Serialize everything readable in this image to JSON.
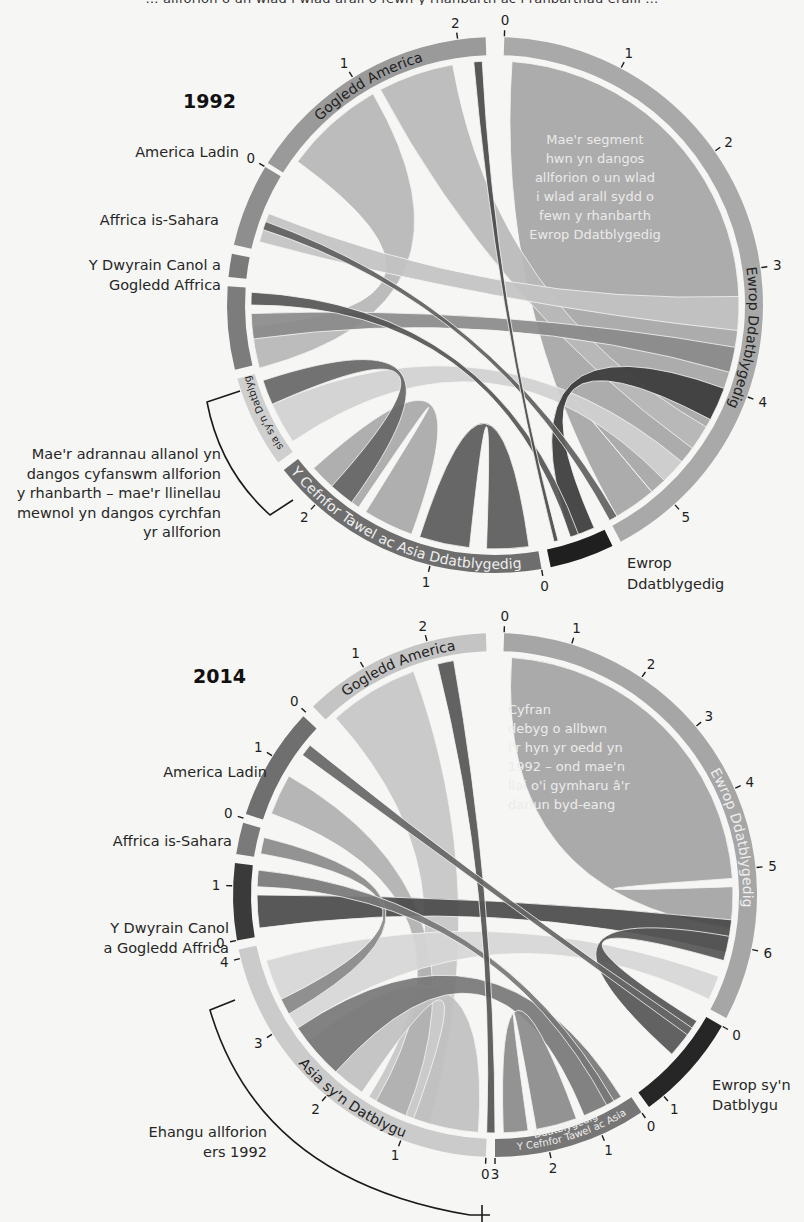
{
  "header": {
    "cut_text": "… allforion o un wlad i wlad arall o fewn y rhanbarth ac i ranbarthau eraill …"
  },
  "chart_data": [
    {
      "type": "chord",
      "title": "1992",
      "center": [
        495,
        305
      ],
      "ring": {
        "outer": 268,
        "inner": 250
      },
      "chord_radius": 244,
      "regions": [
        {
          "name": "Ewrop Ddatblygedig",
          "start": 2,
          "end": 152,
          "color": "#a9a9a9",
          "label_color": "#222",
          "ticks": [
            {
              "a": 2,
              "v": "0"
            },
            {
              "a": 28,
              "v": "1"
            },
            {
              "a": 55,
              "v": "2"
            },
            {
              "a": 82,
              "v": "3"
            },
            {
              "a": 110,
              "v": "4"
            },
            {
              "a": 138,
              "v": "5"
            }
          ]
        },
        {
          "name": "Ewrop Ddatblygedig (Dwyrain)",
          "start": 154,
          "end": 168,
          "color": "#1f1f1f",
          "label_color": "#fff",
          "ticks": [
            {
              "a": 170,
              "v": "0"
            }
          ]
        },
        {
          "name": "Y Cefnfor Tawel ac Asia Ddatblygedig",
          "start": 170,
          "end": 232,
          "color": "#6e6e6e",
          "label_color": "#eee",
          "ticks": [
            {
              "a": 194,
              "v": "1"
            },
            {
              "a": 222,
              "v": "2"
            }
          ]
        },
        {
          "name": "Asia sy'n Datblygu",
          "start": 234,
          "end": 254,
          "color": "#cfcfcf",
          "label_color": "#222",
          "ticks": []
        },
        {
          "name": "Y Dwyrain Canol a Gogledd Affrica",
          "start": 256,
          "end": 274,
          "color": "#7c7c7c",
          "label_color": "#fff",
          "ticks": []
        },
        {
          "name": "Affrica is-Sahara",
          "start": 276,
          "end": 281,
          "color": "#7a7a7a",
          "label_color": "#fff",
          "ticks": []
        },
        {
          "name": "America Ladin",
          "start": 283,
          "end": 301,
          "color": "#8e8e8e",
          "label_color": "#fff",
          "ticks": [
            {
              "a": 301,
              "v": "0"
            }
          ]
        },
        {
          "name": "Gogledd America",
          "start": 302,
          "end": 358,
          "color": "#9a9a9a",
          "label_color": "#222",
          "ticks": [
            {
              "a": 328,
              "v": "1"
            },
            {
              "a": 352,
              "v": "2"
            }
          ]
        }
      ],
      "chords": [
        {
          "a1": 4,
          "a2": 140,
          "b1": 140,
          "b2": 150,
          "color": "#a5a5a5"
        },
        {
          "a1": 306,
          "a2": 330,
          "b1": 255,
          "b2": 265,
          "color": "#b6b6b6"
        },
        {
          "a1": 332,
          "a2": 350,
          "b1": 120,
          "b2": 126,
          "color": "#b9b9b9"
        },
        {
          "a1": 285,
          "a2": 292,
          "b1": 88,
          "b2": 96,
          "color": "#c2c2c2"
        },
        {
          "a1": 262,
          "a2": 268,
          "b1": 100,
          "b2": 106,
          "color": "#8a8a8a"
        },
        {
          "a1": 172,
          "a2": 182,
          "b1": 186,
          "b2": 198,
          "color": "#5a5a5a"
        },
        {
          "a1": 200,
          "a2": 212,
          "b1": 214,
          "b2": 228,
          "color": "#a8a8a8"
        },
        {
          "a1": 236,
          "a2": 246,
          "b1": 130,
          "b2": 136,
          "color": "#d0d0d0"
        },
        {
          "a1": 156,
          "a2": 162,
          "b1": 110,
          "b2": 118,
          "color": "#3a3a3a"
        },
        {
          "a1": 246,
          "a2": 252,
          "b1": 216,
          "b2": 222,
          "color": "#666"
        },
        {
          "a1": 270,
          "a2": 273,
          "b1": 160,
          "b2": 162,
          "color": "#555"
        },
        {
          "a1": 288,
          "a2": 290,
          "b1": 150,
          "b2": 152,
          "color": "#606060"
        },
        {
          "a1": 355,
          "a2": 357,
          "b1": 165,
          "b2": 166,
          "color": "#4a4a4a"
        }
      ],
      "annotations": {
        "inner_note": [
          "Mae'r segment",
          "hwn yn dangos",
          "allforion o un wlad",
          "i wlad arall sydd o",
          "fewn y rhanbarth",
          "Ewrop Ddatblygedig"
        ],
        "outer_note": [
          "Mae'r adrannau allanol yn",
          "dangos cyfanswm allforion",
          "y rhanbarth – mae'r llinellau",
          "mewnol yn dangos cyrchfan",
          "yr allforion"
        ]
      }
    },
    {
      "type": "chord",
      "title": "2014",
      "center": [
        495,
        895
      ],
      "ring": {
        "outer": 262,
        "inner": 244
      },
      "chord_radius": 238,
      "regions": [
        {
          "name": "Ewrop Ddatblygedig",
          "start": 2,
          "end": 118,
          "color": "#a6a6a6",
          "label_color": "#eee",
          "ticks": [
            {
              "a": 2,
              "v": "0"
            },
            {
              "a": 17,
              "v": "1"
            },
            {
              "a": 34,
              "v": "2"
            },
            {
              "a": 50,
              "v": "3"
            },
            {
              "a": 66,
              "v": "4"
            },
            {
              "a": 84,
              "v": "5"
            },
            {
              "a": 102,
              "v": "6"
            }
          ]
        },
        {
          "name": "Ewrop sy'n Datblygu",
          "start": 120,
          "end": 144,
          "color": "#262626",
          "label_color": "#fff",
          "ticks": [
            {
              "a": 120,
              "v": "0"
            },
            {
              "a": 140,
              "v": "1"
            }
          ]
        },
        {
          "name": "Y Cefnfor Tawel ac Asia Ddatblygedig",
          "start": 146,
          "end": 180,
          "color": "#767676",
          "label_color": "#eee",
          "ticks": [
            {
              "a": 146,
              "v": "0"
            },
            {
              "a": 156,
              "v": "1"
            },
            {
              "a": 168,
              "v": "2"
            },
            {
              "a": 180,
              "v": "3"
            }
          ]
        },
        {
          "name": "Asia sy'n Datblygu",
          "start": 182,
          "end": 258,
          "color": "#cbcbcb",
          "label_color": "#222",
          "ticks": [
            {
              "a": 182,
              "v": "0"
            },
            {
              "a": 201,
              "v": "1"
            },
            {
              "a": 220,
              "v": "2"
            },
            {
              "a": 238,
              "v": "3"
            },
            {
              "a": 256,
              "v": "4"
            }
          ]
        },
        {
          "name": "Y Dwyrain Canol a Gogledd Affrica",
          "start": 260,
          "end": 277,
          "color": "#3a3a3a",
          "label_color": "#fff",
          "ticks": [
            {
              "a": 260,
              "v": "0"
            },
            {
              "a": 272,
              "v": "1"
            }
          ]
        },
        {
          "name": "Affrica is-Sahara",
          "start": 279,
          "end": 286,
          "color": "#7a7a7a",
          "label_color": "#fff",
          "ticks": [
            {
              "a": 287,
              "v": "0"
            }
          ]
        },
        {
          "name": "America Ladin",
          "start": 288,
          "end": 313,
          "color": "#6f6f6f",
          "label_color": "#fff",
          "ticks": [
            {
              "a": 302,
              "v": "1"
            },
            {
              "a": 314,
              "v": "0"
            }
          ]
        },
        {
          "name": "Gogledd America",
          "start": 316,
          "end": 358,
          "color": "#c4c4c4",
          "label_color": "#222",
          "ticks": [
            {
              "a": 330,
              "v": "1"
            },
            {
              "a": 345,
              "v": "2"
            }
          ]
        }
      ],
      "chords": [
        {
          "a1": 4,
          "a2": 86,
          "b1": 88,
          "b2": 98,
          "color": "#a3a3a3"
        },
        {
          "a1": 318,
          "a2": 340,
          "b1": 196,
          "b2": 212,
          "color": "#c6c6c6"
        },
        {
          "a1": 290,
          "a2": 300,
          "b1": 202,
          "b2": 210,
          "color": "#b0b0b0"
        },
        {
          "a1": 262,
          "a2": 270,
          "b1": 96,
          "b2": 104,
          "color": "#4a4a4a"
        },
        {
          "a1": 184,
          "a2": 200,
          "b1": 214,
          "b2": 232,
          "color": "#c0c0c0"
        },
        {
          "a1": 236,
          "a2": 254,
          "b1": 110,
          "b2": 116,
          "color": "#d6d6d6"
        },
        {
          "a1": 148,
          "a2": 158,
          "b1": 222,
          "b2": 236,
          "color": "#777"
        },
        {
          "a1": 160,
          "a2": 170,
          "b1": 172,
          "b2": 178,
          "color": "#8a8a8a"
        },
        {
          "a1": 122,
          "a2": 132,
          "b1": 100,
          "b2": 106,
          "color": "#555"
        },
        {
          "a1": 280,
          "a2": 284,
          "b1": 240,
          "b2": 244,
          "color": "#8a8a8a"
        },
        {
          "a1": 272,
          "a2": 276,
          "b1": 150,
          "b2": 152,
          "color": "#777"
        },
        {
          "a1": 346,
          "a2": 350,
          "b1": 180,
          "b2": 182,
          "color": "#555"
        },
        {
          "a1": 306,
          "a2": 309,
          "b1": 124,
          "b2": 126,
          "color": "#666"
        }
      ],
      "annotations": {
        "inner_note": [
          "Cyfran",
          "debyg o allbwn",
          "i'r hyn yr oedd yn",
          "1992 – ond mae'n",
          "llai o'i gymharu â'r",
          "darlun byd-eang"
        ],
        "outer_note": [
          "Ehangu allforion",
          "ers 1992"
        ]
      }
    }
  ],
  "labels_1992": {
    "year": "1992",
    "gogledd_america": "Gogledd America",
    "america_ladin": "America Ladin",
    "affrica": "Affrica is-Sahara",
    "dwyrain_canol": [
      "Y Dwyrain Canol a",
      "Gogledd Affrica"
    ],
    "asia_datblygu": "Asia sy'n Datblygu",
    "cefnfor": "Y Cefnfor Tawel ac Asia Ddatblygedig",
    "ewrop_ring": "Ewrop Ddatblygedig",
    "ewrop_outer": [
      "Ewrop",
      "Ddatblygedig"
    ]
  },
  "labels_2014": {
    "year": "2014",
    "gogledd_america": "Gogledd America",
    "america_ladin": "America Ladin",
    "affrica": "Affrica is-Sahara",
    "dwyrain_canol": [
      "Y Dwyrain Canol",
      "a Gogledd Affrica"
    ],
    "asia_datblygu": "Asia sy'n Datblygu",
    "cefnfor": [
      "Y Cefnfor Tawel ac Asia",
      "Ddatblygedig"
    ],
    "ewrop_ring": "Ewrop Ddatblygedig",
    "ewrop_outer": [
      "Ewrop sy'n",
      "Datblygu"
    ]
  }
}
